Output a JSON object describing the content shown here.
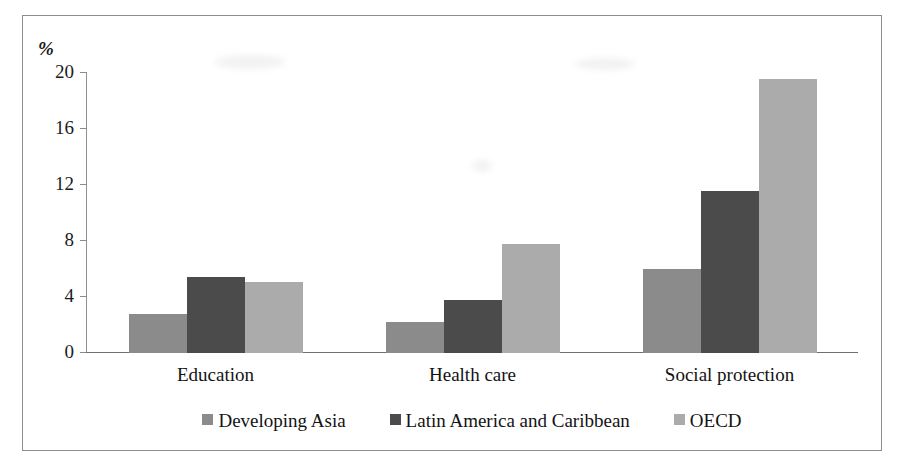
{
  "chart_data": {
    "type": "bar",
    "title": "",
    "xlabel": "",
    "ylabel": "%",
    "ylim": [
      0,
      20
    ],
    "yticks": [
      0,
      4,
      8,
      12,
      16,
      20
    ],
    "ytick_labels": [
      "0",
      "4",
      "8",
      "12",
      "16",
      "20"
    ],
    "grid": false,
    "legend_position": "bottom",
    "categories": [
      "Education",
      "Health care",
      "Social protection"
    ],
    "series": [
      {
        "name": "Developing Asia",
        "color": "#8b8b8b",
        "values": [
          2.8,
          2.2,
          6.0
        ]
      },
      {
        "name": "Latin America and Caribbean",
        "color": "#4b4b4b",
        "values": [
          5.4,
          3.8,
          11.6
        ]
      },
      {
        "name": "OECD",
        "color": "#ababab",
        "values": [
          5.1,
          7.8,
          19.6
        ]
      }
    ]
  },
  "axis": {
    "unit_symbol": "%"
  },
  "legend": {
    "items": [
      {
        "label": "Developing Asia",
        "color": "#8b8b8b"
      },
      {
        "label": "Latin America and Caribbean",
        "color": "#4b4b4b"
      },
      {
        "label": "OECD",
        "color": "#ababab"
      }
    ]
  }
}
